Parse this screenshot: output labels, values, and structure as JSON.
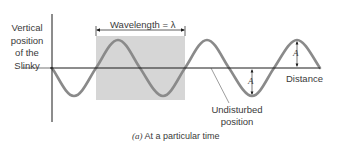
{
  "figure": {
    "y_axis_label": [
      "Vertical",
      "position",
      "of the",
      "Slinky"
    ],
    "x_axis_label": "Distance",
    "wavelength_label": "Wavelength = λ",
    "amplitude_label": "A",
    "undisturbed_label": [
      "Undisturbed",
      "position"
    ],
    "caption_prefix": "(a)",
    "caption_text": " At a particular time",
    "colors": {
      "wave": "#8a8a8a",
      "shade": "#d6d6d6",
      "axis": "#1a1a1a"
    }
  }
}
